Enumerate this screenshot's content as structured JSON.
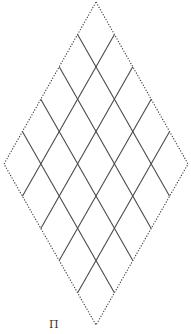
{
  "diagram": {
    "type": "rhombus-grid",
    "divisions": 5,
    "vertices": {
      "top": [
        96,
        2
      ],
      "right": [
        188,
        164
      ],
      "bottom": [
        96,
        325
      ],
      "left": [
        4,
        164
      ]
    },
    "colors": {
      "outline": "#3a3a3a",
      "grid": "#4a4a4a",
      "background": "#ffffff"
    },
    "label": {
      "text": "Π",
      "x": 49,
      "y": 319
    }
  }
}
